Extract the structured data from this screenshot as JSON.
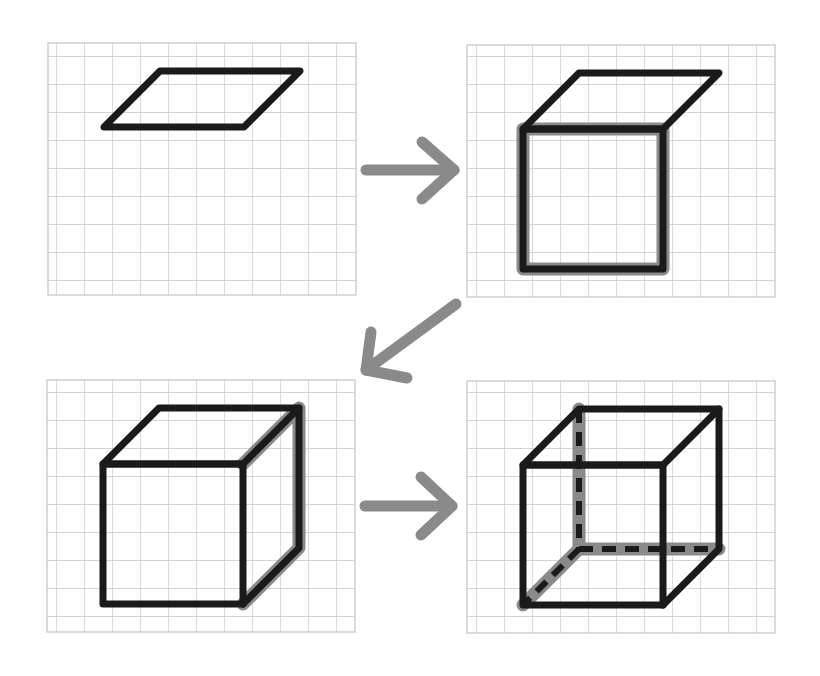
{
  "colors": {
    "background": "#ffffff",
    "grid": "#c8c8c8",
    "line": "#1a1a1a",
    "highlight": "#8a8a8a",
    "arrow": "#8a8a8a"
  },
  "grid": {
    "cell": 28,
    "cols": 11,
    "rows": 9
  },
  "panels": [
    {
      "id": "step-1",
      "label": "Step 1: draw a parallelogram (top face)",
      "origin": [
        48,
        43
      ]
    },
    {
      "id": "step-2",
      "label": "Step 2: draw a square below (front face)",
      "origin": [
        467,
        45
      ]
    },
    {
      "id": "step-3",
      "label": "Step 3: connect the right side",
      "origin": [
        47,
        380
      ]
    },
    {
      "id": "step-4",
      "label": "Step 4: add hidden edges as dashed lines",
      "origin": [
        467,
        381
      ]
    }
  ],
  "arrows": [
    {
      "id": "arrow-1-to-2",
      "direction": "right"
    },
    {
      "id": "arrow-2-to-3",
      "direction": "down-left"
    },
    {
      "id": "arrow-3-to-4",
      "direction": "right"
    }
  ]
}
